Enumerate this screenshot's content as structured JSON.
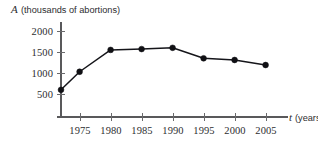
{
  "chart_data": {
    "type": "line",
    "title": "",
    "subtitle": "",
    "ylabel_variable": "A",
    "ylabel_units": "(thousands of abortions)",
    "ylabel": "A (thousands of abortions)",
    "xlabel_variable": "t",
    "xlabel_units": "(years)",
    "xlabel": "t (years)",
    "x": [
      1972,
      1975,
      1980,
      1985,
      1990,
      1995,
      2000,
      2005
    ],
    "values": [
      600,
      1030,
      1550,
      1570,
      1600,
      1350,
      1310,
      1190
    ],
    "categories": [
      "1972",
      "1975",
      "1980",
      "1985",
      "1990",
      "1995",
      "2000",
      "2005"
    ],
    "xticks": [
      1975,
      1980,
      1985,
      1990,
      1995,
      2000,
      2005
    ],
    "xtick_labels": [
      "1975",
      "1980",
      "1985",
      "1990",
      "1995",
      "2000",
      "2005"
    ],
    "yticks": [
      500,
      1000,
      1500,
      2000
    ],
    "ytick_labels": [
      "500",
      "1000",
      "1500",
      "2000"
    ],
    "xlim": [
      1972,
      2008
    ],
    "ylim": [
      0,
      2120
    ],
    "grid": false,
    "legend": false,
    "legend_position": "none",
    "marker": "filled-circle",
    "line_color": "#101014",
    "marker_color": "#101014",
    "axis_color": "#59595b",
    "background_color": "#ffffff"
  }
}
